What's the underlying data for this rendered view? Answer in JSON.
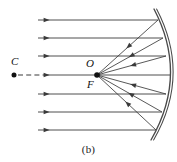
{
  "figure": {
    "caption": "(b)",
    "type": "concave-mirror-ray-diagram",
    "labels": {
      "center_of_curvature": "C",
      "vertex_or_origin": "O",
      "focal_point": "F"
    },
    "colors": {
      "ray": "#3a3a3a",
      "mirror": "#4a4a4a",
      "text": "#111111",
      "background": "#ffffff"
    }
  },
  "chart_data": {
    "type": "diagram",
    "title": "(b)",
    "canvas": {
      "width": 177,
      "height": 162
    },
    "axis": {
      "principal_axis_y": 75,
      "principal_axis_x_start": 14,
      "principal_axis_x_end": 170
    },
    "points": [
      {
        "name": "C",
        "label": "C",
        "x": 14,
        "y": 75,
        "marker": "filled-dot",
        "note": "center of curvature"
      },
      {
        "name": "F",
        "label": "F",
        "x": 97,
        "y": 75,
        "marker": "filled-dot",
        "note": "focal point / O"
      }
    ],
    "dashed_segment": {
      "x1": 18,
      "y1": 75,
      "x2": 44,
      "y2": 75
    },
    "incoming_rays": [
      {
        "y": 20,
        "x_start": 38,
        "x_end": 158,
        "arrow_x": 47,
        "direction": "right"
      },
      {
        "y": 38,
        "x_start": 38,
        "x_end": 163,
        "arrow_x": 47,
        "direction": "right"
      },
      {
        "y": 56,
        "x_start": 38,
        "x_end": 166,
        "arrow_x": 47,
        "direction": "right"
      },
      {
        "y": 75,
        "x_start": 44,
        "x_end": 170,
        "arrow_x": 47,
        "direction": "right"
      },
      {
        "y": 94,
        "x_start": 38,
        "x_end": 166,
        "arrow_x": 47,
        "direction": "right"
      },
      {
        "y": 112,
        "x_start": 38,
        "x_end": 162,
        "arrow_x": 47,
        "direction": "right"
      },
      {
        "y": 130,
        "x_start": 38,
        "x_end": 156,
        "arrow_x": 47,
        "direction": "right"
      }
    ],
    "reflected_rays": [
      {
        "from_x": 158,
        "from_y": 20,
        "to_x": 97,
        "to_y": 75,
        "arrow_t": 0.52,
        "direction": "toward-F"
      },
      {
        "from_x": 163,
        "from_y": 38,
        "to_x": 97,
        "to_y": 75,
        "arrow_t": 0.52,
        "direction": "toward-F"
      },
      {
        "from_x": 166,
        "from_y": 56,
        "to_x": 97,
        "to_y": 75,
        "arrow_t": 0.52,
        "direction": "toward-F"
      },
      {
        "from_x": 166,
        "from_y": 94,
        "to_x": 97,
        "to_y": 75,
        "arrow_t": 0.52,
        "direction": "toward-F"
      },
      {
        "from_x": 162,
        "from_y": 112,
        "to_x": 97,
        "to_y": 75,
        "arrow_t": 0.52,
        "direction": "toward-F"
      },
      {
        "from_x": 156,
        "from_y": 130,
        "to_x": 97,
        "to_y": 75,
        "arrow_t": 0.52,
        "direction": "toward-F"
      }
    ],
    "mirror": {
      "shape": "arc",
      "double_line": true,
      "top_x": 154,
      "top_y": 9,
      "vertex_x": 171,
      "vertex_y": 75,
      "bottom_x": 151,
      "bottom_y": 140
    }
  }
}
